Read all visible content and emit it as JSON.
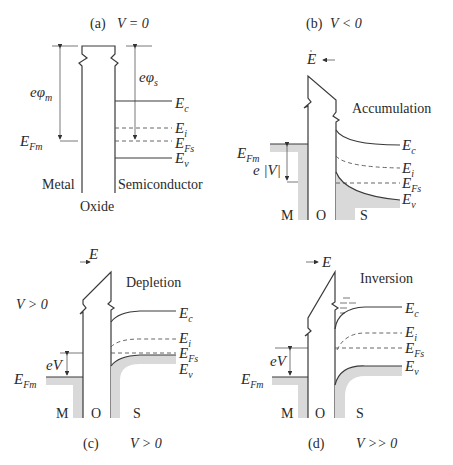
{
  "panels": {
    "a": {
      "caption": "(a)",
      "condition": "V = 0",
      "labels": {
        "ephi_m": "eφ",
        "ephi_m_sub": "m",
        "ephi_s": "eφ",
        "ephi_s_sub": "s",
        "Ec": "E",
        "Ec_sub": "c",
        "Ei": "E",
        "Ei_sub": "i",
        "EFs": "E",
        "EFs_sub": "Fs",
        "Ev": "E",
        "Ev_sub": "v",
        "EFm": "E",
        "EFm_sub": "Fm",
        "metal": "Metal",
        "oxide": "Oxide",
        "semiconductor": "Semiconductor"
      }
    },
    "b": {
      "caption": "(b)",
      "condition": "V < 0",
      "field": "E",
      "regime": "Accumulation",
      "labels": {
        "Ec": "E",
        "Ec_sub": "c",
        "Ei": "E",
        "Ei_sub": "i",
        "EFs": "E",
        "EFs_sub": "Fs",
        "Ev": "E",
        "Ev_sub": "v",
        "EFm": "E",
        "EFm_sub": "Fm",
        "eV": "e |V|",
        "M": "M",
        "O": "O",
        "S": "S"
      }
    },
    "c": {
      "caption": "(c)",
      "condition": "V > 0",
      "side_condition": "V > 0",
      "field": "E",
      "regime": "Depletion",
      "labels": {
        "Ec": "E",
        "Ec_sub": "c",
        "Ei": "E",
        "Ei_sub": "i",
        "EFs": "E",
        "EFs_sub": "Fs",
        "Ev": "E",
        "Ev_sub": "v",
        "EFm": "E",
        "EFm_sub": "Fm",
        "eV": "eV",
        "M": "M",
        "O": "O",
        "S": "S"
      }
    },
    "d": {
      "caption": "(d)",
      "condition": "V >> 0",
      "field": "E",
      "regime": "Inversion",
      "labels": {
        "Ec": "E",
        "Ec_sub": "c",
        "Ei": "E",
        "Ei_sub": "i",
        "EFs": "E",
        "EFs_sub": "Fs",
        "Ev": "E",
        "Ev_sub": "v",
        "EFm": "E",
        "EFm_sub": "Fm",
        "eV": "eV",
        "M": "M",
        "O": "O",
        "S": "S"
      }
    }
  }
}
